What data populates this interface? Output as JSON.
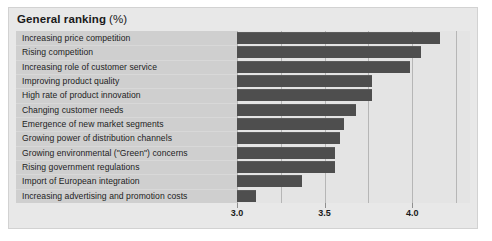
{
  "title": {
    "main": "General ranking",
    "unit": "(%)"
  },
  "colors": {
    "page_background": "#ffffff",
    "panel_background": "#e8e8e8",
    "label_column_background": "#cfcfcf",
    "plot_background": "#e4e4e4",
    "bar": "#4e4e4e",
    "gridline": "#b6b6b6",
    "text": "#1a1a1a"
  },
  "chart_data": {
    "type": "bar",
    "orientation": "horizontal",
    "xlabel": "",
    "ylabel": "",
    "xlim": [
      3.0,
      4.33
    ],
    "xticks": [
      3.0,
      3.5,
      4.0
    ],
    "xtick_labels": [
      "3.0",
      "3.5",
      "4.0"
    ],
    "gridlines": [
      3.0,
      3.25,
      3.5,
      3.75,
      4.0,
      4.25
    ],
    "grid": true,
    "legend": "none",
    "categories": [
      "Increasing price competition",
      "Rising competition",
      "Increasing role of customer service",
      "Improving product quality",
      "High rate of product innovation",
      "Changing customer needs",
      "Emergence of new market segments",
      "Growing power of distribution channels",
      "Growing environmental (\"Green\") concerns",
      "Rising government regulations",
      "Import of European integration",
      "Increasing advertising and promotion costs"
    ],
    "values": [
      4.16,
      4.05,
      3.99,
      3.77,
      3.77,
      3.68,
      3.61,
      3.59,
      3.56,
      3.56,
      3.37,
      3.11
    ]
  }
}
